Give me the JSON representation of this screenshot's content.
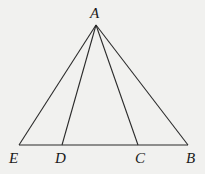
{
  "diagram": {
    "type": "geometry-triangle",
    "points": {
      "A": {
        "label": "A",
        "x": 96,
        "y": 25
      },
      "E": {
        "label": "E",
        "x": 19,
        "y": 145
      },
      "D": {
        "label": "D",
        "x": 62,
        "y": 145
      },
      "C": {
        "label": "C",
        "x": 138,
        "y": 145
      },
      "B": {
        "label": "B",
        "x": 188,
        "y": 145
      }
    },
    "segments": [
      "AE",
      "AD",
      "AC",
      "AB",
      "EB"
    ],
    "colors": {
      "background": "#f1f1ef",
      "stroke": "#2a2a2a"
    }
  }
}
